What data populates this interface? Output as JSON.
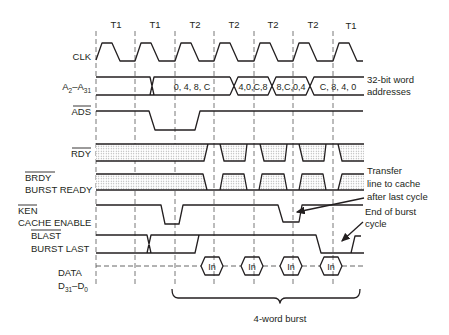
{
  "periods": [
    "T1",
    "T1",
    "T2",
    "T2",
    "T2",
    "T2",
    "T1"
  ],
  "signals": {
    "clk": {
      "label": "CLK"
    },
    "addr": {
      "label_main": "A",
      "sub1": "2",
      "dash": "–",
      "label_main2": "A",
      "sub2": "31",
      "values": [
        "0, 4, 8, C",
        "4,0,C,8",
        "8,C,0,4",
        "C, 8, 4, 0"
      ],
      "note_line1": "32-bit word",
      "note_line2": "addresses"
    },
    "ads": {
      "label": "ADS",
      "active_low": true
    },
    "rdy": {
      "label": "RDY",
      "active_low": true
    },
    "brdy": {
      "label": "BRDY",
      "label2": "BURST READY",
      "active_low": true
    },
    "ken": {
      "label": "KEN",
      "label2": "CACHE ENABLE",
      "active_low": true
    },
    "blast": {
      "label": "BLAST",
      "label2": "BURST LAST",
      "active_low": true
    },
    "data": {
      "label": "DATA",
      "label2_main": "D",
      "sub1": "31",
      "dash": "–",
      "label2_main2": "D",
      "sub2": "0",
      "values": [
        "In",
        "In",
        "In",
        "In"
      ]
    }
  },
  "annotations": {
    "transfer_line1": "Transfer",
    "transfer_line2": "line to cache",
    "transfer_line3": "after last cycle",
    "end_line1": "End of burst",
    "end_line2": "cycle",
    "burst": "4-word burst"
  }
}
